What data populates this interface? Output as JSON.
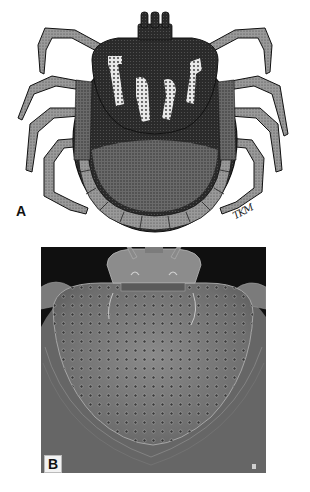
{
  "figure": {
    "panels": [
      {
        "id": "A",
        "label": "A",
        "kind": "stipple-drawing",
        "subject": "tick dorsal view (illustration)",
        "signature": "TKM"
      },
      {
        "id": "B",
        "label": "B",
        "kind": "scanning-electron-micrograph",
        "subject": "tick scutum and capitulum (SEM)",
        "scale_mark": "▮"
      }
    ],
    "colors": {
      "background": "#ffffff",
      "ink": "#1a1a1a",
      "sem_background": "#101010",
      "sem_surface": "#7a7a7a"
    }
  }
}
